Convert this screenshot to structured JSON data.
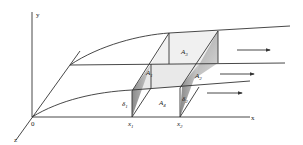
{
  "figure": {
    "type": "3D flow diagram with control volume between two planes",
    "axes": {
      "x_label": "x",
      "y_label": "y",
      "z_label": "z",
      "origin_label": "0"
    },
    "positions": [
      {
        "label": "x",
        "sub": "1"
      },
      {
        "label": "x",
        "sub": "2"
      }
    ],
    "areas": [
      {
        "label": "A",
        "sub": "1"
      },
      {
        "label": "A",
        "sub": "2"
      },
      {
        "label": "A",
        "sub": "3"
      },
      {
        "label": "A",
        "sub": "4"
      }
    ],
    "thicknesses": [
      {
        "label": "δ",
        "sub": "1"
      },
      {
        "label": "δ",
        "sub": "2"
      }
    ],
    "flow_arrows": 3,
    "colors": {
      "line": "#333333",
      "shade_light": "#e6e6e6",
      "shade_mid": "#bdbdbd",
      "shade_dark": "#8a8a8a"
    }
  }
}
